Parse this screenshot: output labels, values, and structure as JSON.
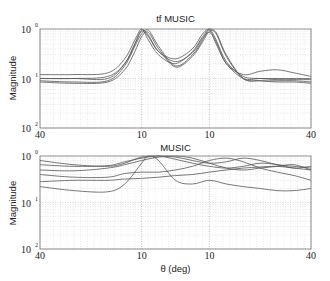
{
  "chart_data": [
    {
      "type": "line",
      "title": "tf MUSIC",
      "xlabel": "",
      "ylabel": "Magnitude",
      "yscale": "log",
      "ylim": [
        0.01,
        1
      ],
      "xlim": [
        -40,
        40
      ],
      "x_ticks": [
        -40,
        -10,
        10,
        40
      ],
      "x_tick_labels": [
        "40",
        "10",
        "10",
        "40"
      ],
      "y_tick_labels": [
        "10^0",
        "10^-1",
        "10^-2"
      ],
      "grid": "major+minor dotted",
      "legend": null,
      "series": [
        {
          "name": "trace 1",
          "x": [
            -40,
            -30,
            -20,
            -15,
            -12,
            -10,
            -8,
            -5,
            0,
            5,
            8,
            10,
            12,
            15,
            20,
            25,
            30,
            35,
            40
          ],
          "values": [
            0.12,
            0.12,
            0.13,
            0.25,
            0.6,
            1.0,
            0.6,
            0.3,
            0.2,
            0.35,
            0.7,
            0.95,
            0.5,
            0.2,
            0.1,
            0.1,
            0.1,
            0.1,
            0.1
          ]
        },
        {
          "name": "trace 2",
          "x": [
            -40,
            -30,
            -20,
            -15,
            -12,
            -10,
            -8,
            -5,
            0,
            5,
            8,
            10,
            12,
            15,
            20,
            25,
            30,
            35,
            40
          ],
          "values": [
            0.1,
            0.1,
            0.1,
            0.2,
            0.5,
            0.9,
            0.7,
            0.35,
            0.25,
            0.4,
            0.8,
            1.0,
            0.6,
            0.22,
            0.11,
            0.1,
            0.095,
            0.095,
            0.095
          ]
        },
        {
          "name": "trace 3",
          "x": [
            -40,
            -30,
            -20,
            -15,
            -12,
            -10,
            -8,
            -5,
            0,
            5,
            8,
            10,
            12,
            15,
            20,
            25,
            30,
            35,
            40
          ],
          "values": [
            0.09,
            0.085,
            0.09,
            0.18,
            0.45,
            0.8,
            0.95,
            0.45,
            0.18,
            0.3,
            0.6,
            1.0,
            0.85,
            0.3,
            0.1,
            0.09,
            0.09,
            0.09,
            0.085
          ]
        },
        {
          "name": "trace 4",
          "x": [
            -40,
            -30,
            -20,
            -15,
            -12,
            -10,
            -8,
            -5,
            0,
            5,
            8,
            10,
            12,
            15,
            20,
            25,
            30,
            35,
            40
          ],
          "values": [
            0.085,
            0.08,
            0.085,
            0.15,
            0.35,
            0.7,
            0.85,
            0.4,
            0.17,
            0.28,
            0.55,
            0.9,
            0.8,
            0.28,
            0.1,
            0.09,
            0.085,
            0.085,
            0.08
          ]
        },
        {
          "name": "trace 5",
          "x": [
            -40,
            -30,
            -20,
            -15,
            -12,
            -10,
            -8,
            -5,
            0,
            5,
            8,
            10,
            12,
            15,
            20,
            25,
            30,
            35,
            40
          ],
          "values": [
            0.1,
            0.1,
            0.11,
            0.2,
            0.5,
            0.95,
            0.75,
            0.35,
            0.22,
            0.33,
            0.65,
            0.85,
            0.55,
            0.2,
            0.12,
            0.14,
            0.15,
            0.13,
            0.11
          ]
        }
      ]
    },
    {
      "type": "line",
      "title": "MUSIC",
      "xlabel": "θ (deg)",
      "ylabel": "Magnitude",
      "yscale": "log",
      "ylim": [
        0.01,
        1
      ],
      "xlim": [
        -40,
        40
      ],
      "x_ticks": [
        -40,
        -10,
        10,
        40
      ],
      "x_tick_labels": [
        "40",
        "10",
        "10",
        "40"
      ],
      "y_tick_labels": [
        "10^0",
        "10^-1",
        "10^-2"
      ],
      "grid": "major+minor dotted",
      "legend": null,
      "series": [
        {
          "name": "trace 1",
          "x": [
            -40,
            -30,
            -20,
            -15,
            -10,
            -5,
            0,
            5,
            10,
            15,
            20,
            25,
            30,
            35,
            40
          ],
          "values": [
            0.8,
            0.65,
            0.6,
            0.7,
            0.95,
            1.0,
            0.85,
            0.7,
            0.6,
            0.55,
            0.6,
            0.7,
            0.65,
            0.55,
            0.6
          ]
        },
        {
          "name": "trace 2",
          "x": [
            -40,
            -30,
            -20,
            -15,
            -10,
            -5,
            0,
            5,
            10,
            15,
            20,
            25,
            30,
            35,
            40
          ],
          "values": [
            0.65,
            0.6,
            0.62,
            0.75,
            0.9,
            1.0,
            0.95,
            0.8,
            0.7,
            0.75,
            0.9,
            0.8,
            0.65,
            0.6,
            0.55
          ]
        },
        {
          "name": "trace 3",
          "x": [
            -40,
            -30,
            -20,
            -15,
            -10,
            -5,
            0,
            5,
            10,
            15,
            20,
            25,
            30,
            35,
            40
          ],
          "values": [
            0.5,
            0.48,
            0.55,
            0.65,
            0.8,
            0.95,
            1.0,
            0.9,
            0.7,
            0.55,
            0.5,
            0.55,
            0.6,
            0.65,
            0.5
          ]
        },
        {
          "name": "trace 4",
          "x": [
            -40,
            -30,
            -20,
            -15,
            -10,
            -5,
            0,
            5,
            10,
            15,
            20,
            25,
            30,
            35,
            40
          ],
          "values": [
            0.4,
            0.35,
            0.35,
            0.42,
            0.45,
            0.45,
            0.5,
            0.6,
            0.8,
            0.9,
            0.75,
            0.55,
            0.45,
            0.38,
            0.3
          ]
        },
        {
          "name": "trace 5",
          "x": [
            -40,
            -30,
            -20,
            -15,
            -10,
            -5,
            0,
            5,
            10,
            15,
            20,
            25,
            30,
            35,
            40
          ],
          "values": [
            0.28,
            0.3,
            0.3,
            0.32,
            0.33,
            0.35,
            0.38,
            0.4,
            0.45,
            0.5,
            0.55,
            0.58,
            0.6,
            0.55,
            0.5
          ]
        },
        {
          "name": "trace 6",
          "x": [
            -40,
            -30,
            -20,
            -15,
            -10,
            -8,
            -5,
            0,
            5,
            10,
            15,
            20,
            25,
            30,
            35,
            40
          ],
          "values": [
            0.22,
            0.18,
            0.17,
            0.25,
            0.7,
            1.0,
            0.8,
            0.3,
            0.25,
            0.3,
            0.25,
            0.22,
            0.2,
            0.18,
            0.18,
            0.2
          ]
        }
      ]
    }
  ],
  "plots": [
    {
      "title": "tf MUSIC",
      "ylabel": "Magnitude",
      "xticks": [
        "40",
        "10",
        "10",
        "40"
      ]
    },
    {
      "title": "MUSIC",
      "ylabel": "Magnitude",
      "xlabel": "θ (deg)",
      "xticks": [
        "40",
        "10",
        "10",
        "40"
      ]
    }
  ],
  "ytick_base": "10",
  "ytick_exps": [
    "0",
    "1",
    "2"
  ]
}
